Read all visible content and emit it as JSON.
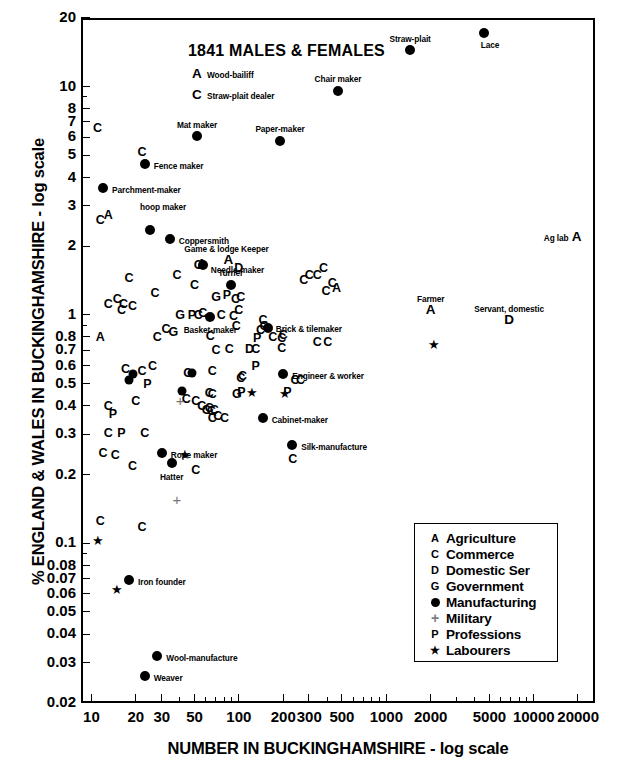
{
  "figure": {
    "top_caption": "",
    "chart_title": "1841 MALES & FEMALES"
  },
  "chart_data": {
    "type": "scatter",
    "title": "1841 MALES & FEMALES",
    "xlabel": "NUMBER IN BUCKINGHAMSHIRE - log scale",
    "ylabel": "% ENGLAND & WALES IN BUCKINGHAMSHIRE - log scale",
    "xscale": "log",
    "yscale": "log",
    "xlim": [
      8.5,
      26000
    ],
    "ylim": [
      0.02,
      20
    ],
    "grid": false,
    "legend_position": "inside-lower-right",
    "xticks": [
      10,
      20,
      30,
      50,
      100,
      200,
      300,
      500,
      1000,
      2000,
      5000,
      10000,
      20000
    ],
    "xtick_labels": [
      "10",
      "20",
      "30",
      "50",
      "100",
      "200",
      "300",
      "500",
      "1000",
      "2000",
      "5000",
      "10000",
      "20000"
    ],
    "yticks": [
      0.02,
      0.03,
      0.04,
      0.05,
      0.06,
      0.07,
      0.08,
      0.1,
      0.2,
      0.3,
      0.4,
      0.5,
      0.6,
      0.7,
      0.8,
      1,
      2,
      3,
      4,
      5,
      6,
      7,
      8,
      10,
      20
    ],
    "ytick_labels": [
      "0.02",
      "0.03",
      "0.04",
      "0.05",
      "0.06",
      "0.07",
      "0.08",
      "0.1",
      "0.2",
      "0.3",
      "0.4",
      "0.5",
      "0.6",
      "0.7",
      "0.8",
      "1",
      "2",
      "3",
      "4",
      "5",
      "6",
      "7",
      "8",
      "10",
      "20"
    ],
    "legend": [
      {
        "symbol": "A",
        "label": "Agriculture",
        "kind": "letter"
      },
      {
        "symbol": "C",
        "label": "Commerce",
        "kind": "letter"
      },
      {
        "symbol": "D",
        "label": "Domestic Ser",
        "kind": "letter"
      },
      {
        "symbol": "G",
        "label": "Government",
        "kind": "letter"
      },
      {
        "symbol": "●",
        "label": "Manufacturing",
        "kind": "dot"
      },
      {
        "symbol": "+",
        "label": "Military",
        "kind": "plus"
      },
      {
        "symbol": "P",
        "label": "Professions",
        "kind": "letter"
      },
      {
        "symbol": "★",
        "label": "Labourers",
        "kind": "star"
      }
    ],
    "labeled_points": [
      {
        "label": "Lace",
        "kind": "dot",
        "x": 4600,
        "y": 17.2,
        "lx": 6,
        "ly": 11,
        "anchor": "center"
      },
      {
        "label": "Straw-plait",
        "kind": "dot",
        "x": 1450,
        "y": 14.5,
        "lx": 0,
        "ly": -12,
        "anchor": "center"
      },
      {
        "label": "Chair maker",
        "kind": "dot",
        "x": 470,
        "y": 9.6,
        "lx": 0,
        "ly": -13,
        "anchor": "center"
      },
      {
        "label": "Wood-bailiff",
        "kind": "A",
        "x": 52,
        "y": 11.4,
        "lx": 10,
        "ly": 0,
        "anchor": "left"
      },
      {
        "label": "Straw-plait dealer",
        "kind": "C",
        "x": 52,
        "y": 9.2,
        "lx": 10,
        "ly": 0,
        "anchor": "left"
      },
      {
        "label": "Mat maker",
        "kind": "dot",
        "x": 52,
        "y": 6.1,
        "lx": 0,
        "ly": -12,
        "anchor": "center"
      },
      {
        "label": "Paper-maker",
        "kind": "dot",
        "x": 190,
        "y": 5.8,
        "lx": 0,
        "ly": -13,
        "anchor": "center"
      },
      {
        "label": "Fence maker",
        "kind": "dot",
        "x": 23,
        "y": 4.6,
        "lx": 9,
        "ly": 1,
        "anchor": "left"
      },
      {
        "label": "Parchment-maker",
        "kind": "dot",
        "x": 12,
        "y": 3.6,
        "lx": 9,
        "ly": 1,
        "anchor": "left"
      },
      {
        "label": "hoop maker",
        "kind": "dot",
        "x": 25,
        "y": 2.35,
        "lx": -10,
        "ly": -24,
        "anchor": "left"
      },
      {
        "label": "Coppersmith",
        "kind": "dot",
        "x": 34,
        "y": 2.15,
        "lx": 9,
        "ly": 1,
        "anchor": "left"
      },
      {
        "label": "Game & lodge Keeper",
        "kind": "A",
        "x": 85,
        "y": 1.75,
        "lx": -2,
        "ly": -12,
        "anchor": "center"
      },
      {
        "label": "Needle-maker",
        "kind": "dot",
        "x": 57,
        "y": 1.65,
        "lx": 8,
        "ly": 4,
        "anchor": "left"
      },
      {
        "label": "Turner",
        "kind": "dot",
        "x": 88,
        "y": 1.35,
        "lx": 0,
        "ly": -13,
        "anchor": "center"
      },
      {
        "label": "Farmer",
        "kind": "A",
        "x": 2000,
        "y": 1.05,
        "lx": 0,
        "ly": -12,
        "anchor": "center"
      },
      {
        "label": "Servant, domestic",
        "kind": "D",
        "x": 6800,
        "y": 0.95,
        "lx": 0,
        "ly": -12,
        "anchor": "center"
      },
      {
        "label": "Ag lab",
        "kind": "A",
        "x": 19500,
        "y": 2.2,
        "lx": -8,
        "ly": 0,
        "anchor": "right"
      },
      {
        "label": "Basket-maker",
        "kind": "dot",
        "x": 64,
        "y": 0.98,
        "lx": 0,
        "ly": 12,
        "anchor": "center"
      },
      {
        "label": "Brick & tilemaker",
        "kind": "dot",
        "x": 157,
        "y": 0.88,
        "lx": 8,
        "ly": 0,
        "anchor": "left"
      },
      {
        "label": "Engineer & worker",
        "kind": "dot",
        "x": 200,
        "y": 0.55,
        "lx": 9,
        "ly": 1,
        "anchor": "left"
      },
      {
        "label": "Cabinet-maker",
        "kind": "dot",
        "x": 145,
        "y": 0.355,
        "lx": 9,
        "ly": 1,
        "anchor": "left"
      },
      {
        "label": "Silk-manufacture",
        "kind": "dot",
        "x": 230,
        "y": 0.27,
        "lx": 9,
        "ly": 1,
        "anchor": "left"
      },
      {
        "label": "Rope maker",
        "kind": "dot",
        "x": 30,
        "y": 0.248,
        "lx": 9,
        "ly": 1,
        "anchor": "left"
      },
      {
        "label": "Hatter",
        "kind": "dot",
        "x": 35,
        "y": 0.224,
        "lx": 0,
        "ly": 13,
        "anchor": "center"
      },
      {
        "label": "Iron founder",
        "kind": "dot",
        "x": 18,
        "y": 0.069,
        "lx": 9,
        "ly": 1,
        "anchor": "left"
      },
      {
        "label": "Wool-manufacture",
        "kind": "dot",
        "x": 28,
        "y": 0.0322,
        "lx": 9,
        "ly": 1,
        "anchor": "left"
      },
      {
        "label": "Weaver",
        "kind": "dot",
        "x": 23,
        "y": 0.0262,
        "lx": 9,
        "ly": 1,
        "anchor": "left"
      }
    ],
    "unlabeled_points": [
      {
        "kind": "C",
        "x": 11,
        "y": 6.6
      },
      {
        "kind": "C",
        "x": 22,
        "y": 5.2
      },
      {
        "kind": "A",
        "x": 13,
        "y": 2.75
      },
      {
        "kind": "C",
        "x": 11.5,
        "y": 2.6
      },
      {
        "kind": "C",
        "x": 38,
        "y": 1.5
      },
      {
        "kind": "C",
        "x": 18,
        "y": 1.45
      },
      {
        "kind": "C",
        "x": 27,
        "y": 1.25
      },
      {
        "kind": "C",
        "x": 50,
        "y": 1.35
      },
      {
        "kind": "C",
        "x": 53,
        "y": 1.65
      },
      {
        "kind": "A",
        "x": 56,
        "y": 1.68
      },
      {
        "kind": "D",
        "x": 100,
        "y": 1.6
      },
      {
        "kind": "C",
        "x": 340,
        "y": 1.5
      },
      {
        "kind": "C",
        "x": 375,
        "y": 1.6
      },
      {
        "kind": "C",
        "x": 275,
        "y": 1.42
      },
      {
        "kind": "C",
        "x": 300,
        "y": 1.5
      },
      {
        "kind": "C",
        "x": 430,
        "y": 1.38
      },
      {
        "kind": "C",
        "x": 390,
        "y": 1.28
      },
      {
        "kind": "A",
        "x": 460,
        "y": 1.32
      },
      {
        "kind": "C",
        "x": 13,
        "y": 1.12
      },
      {
        "kind": "C",
        "x": 15,
        "y": 1.17
      },
      {
        "kind": "C",
        "x": 16,
        "y": 1.05
      },
      {
        "kind": "C",
        "x": 16.5,
        "y": 1.12
      },
      {
        "kind": "C",
        "x": 19,
        "y": 1.1
      },
      {
        "kind": "G",
        "x": 70,
        "y": 1.2
      },
      {
        "kind": "P",
        "x": 83,
        "y": 1.22
      },
      {
        "kind": "C",
        "x": 95,
        "y": 1.18
      },
      {
        "kind": "C",
        "x": 103,
        "y": 1.2
      },
      {
        "kind": "G",
        "x": 40,
        "y": 1.0
      },
      {
        "kind": "P",
        "x": 48,
        "y": 1.0
      },
      {
        "kind": "C",
        "x": 53,
        "y": 1.0
      },
      {
        "kind": "C",
        "x": 57,
        "y": 1.02
      },
      {
        "kind": "C",
        "x": 76,
        "y": 1.0
      },
      {
        "kind": "C",
        "x": 92,
        "y": 0.99
      },
      {
        "kind": "C",
        "x": 100,
        "y": 1.05
      },
      {
        "kind": "C",
        "x": 96,
        "y": 0.9
      },
      {
        "kind": "C",
        "x": 146,
        "y": 0.95
      },
      {
        "kind": "C",
        "x": 148,
        "y": 0.9
      },
      {
        "kind": "C",
        "x": 140,
        "y": 0.86
      },
      {
        "kind": "C",
        "x": 32,
        "y": 0.87
      },
      {
        "kind": "G",
        "x": 36,
        "y": 0.84
      },
      {
        "kind": "A",
        "x": 11.5,
        "y": 0.8
      },
      {
        "kind": "C",
        "x": 28,
        "y": 0.8
      },
      {
        "kind": "C",
        "x": 64,
        "y": 0.81
      },
      {
        "kind": "P",
        "x": 133,
        "y": 0.79
      },
      {
        "kind": "C",
        "x": 170,
        "y": 0.8
      },
      {
        "kind": "C",
        "x": 195,
        "y": 0.79
      },
      {
        "kind": "C",
        "x": 200,
        "y": 0.82
      },
      {
        "kind": "C",
        "x": 340,
        "y": 0.76
      },
      {
        "kind": "C",
        "x": 400,
        "y": 0.76
      },
      {
        "kind": "C",
        "x": 70,
        "y": 0.7
      },
      {
        "kind": "C",
        "x": 86,
        "y": 0.71
      },
      {
        "kind": "D",
        "x": 118,
        "y": 0.71
      },
      {
        "kind": "C",
        "x": 130,
        "y": 0.71
      },
      {
        "kind": "C",
        "x": 195,
        "y": 0.72
      },
      {
        "kind": "star",
        "x": 2100,
        "y": 0.74
      },
      {
        "kind": "C",
        "x": 17,
        "y": 0.58
      },
      {
        "kind": "dot",
        "x": 18,
        "y": 0.52
      },
      {
        "kind": "dot",
        "x": 19,
        "y": 0.55
      },
      {
        "kind": "C",
        "x": 22,
        "y": 0.57
      },
      {
        "kind": "C",
        "x": 26,
        "y": 0.6
      },
      {
        "kind": "P",
        "x": 24,
        "y": 0.5
      },
      {
        "kind": "C",
        "x": 45,
        "y": 0.56
      },
      {
        "kind": "dot",
        "x": 48,
        "y": 0.56
      },
      {
        "kind": "C",
        "x": 66,
        "y": 0.57
      },
      {
        "kind": "C",
        "x": 103,
        "y": 0.53
      },
      {
        "kind": "C",
        "x": 106,
        "y": 0.54
      },
      {
        "kind": "P",
        "x": 130,
        "y": 0.6
      },
      {
        "kind": "C",
        "x": 240,
        "y": 0.52
      },
      {
        "kind": "C",
        "x": 262,
        "y": 0.52
      },
      {
        "kind": "dot",
        "x": 41,
        "y": 0.465
      },
      {
        "kind": "C",
        "x": 44,
        "y": 0.43
      },
      {
        "kind": "C",
        "x": 51,
        "y": 0.42
      },
      {
        "kind": "C",
        "x": 63,
        "y": 0.455
      },
      {
        "kind": "C",
        "x": 66,
        "y": 0.45
      },
      {
        "kind": "G",
        "x": 97,
        "y": 0.45
      },
      {
        "kind": "P",
        "x": 104,
        "y": 0.46
      },
      {
        "kind": "star",
        "x": 123,
        "y": 0.455
      },
      {
        "kind": "star",
        "x": 205,
        "y": 0.45
      },
      {
        "kind": "P",
        "x": 213,
        "y": 0.46
      },
      {
        "kind": "plus",
        "x": 40,
        "y": 0.42
      },
      {
        "kind": "C",
        "x": 13,
        "y": 0.4
      },
      {
        "kind": "C",
        "x": 20,
        "y": 0.42
      },
      {
        "kind": "P",
        "x": 14,
        "y": 0.37
      },
      {
        "kind": "C",
        "x": 56,
        "y": 0.4
      },
      {
        "kind": "C",
        "x": 60,
        "y": 0.385
      },
      {
        "kind": "C",
        "x": 63,
        "y": 0.39
      },
      {
        "kind": "C",
        "x": 65,
        "y": 0.38
      },
      {
        "kind": "C",
        "x": 68,
        "y": 0.385
      },
      {
        "kind": "C",
        "x": 66,
        "y": 0.355
      },
      {
        "kind": "C",
        "x": 72,
        "y": 0.36
      },
      {
        "kind": "C",
        "x": 80,
        "y": 0.355
      },
      {
        "kind": "C",
        "x": 13,
        "y": 0.305
      },
      {
        "kind": "P",
        "x": 16,
        "y": 0.305
      },
      {
        "kind": "C",
        "x": 23,
        "y": 0.305
      },
      {
        "kind": "C",
        "x": 12,
        "y": 0.248
      },
      {
        "kind": "C",
        "x": 14.5,
        "y": 0.245
      },
      {
        "kind": "star",
        "x": 43,
        "y": 0.245
      },
      {
        "kind": "C",
        "x": 19,
        "y": 0.218
      },
      {
        "kind": "C",
        "x": 51,
        "y": 0.21
      },
      {
        "kind": "C",
        "x": 232,
        "y": 0.235
      },
      {
        "kind": "plus",
        "x": 38,
        "y": 0.155
      },
      {
        "kind": "C",
        "x": 11.5,
        "y": 0.125
      },
      {
        "kind": "C",
        "x": 22,
        "y": 0.118
      },
      {
        "kind": "star",
        "x": 11,
        "y": 0.102
      },
      {
        "kind": "star",
        "x": 15,
        "y": 0.0625
      }
    ]
  }
}
